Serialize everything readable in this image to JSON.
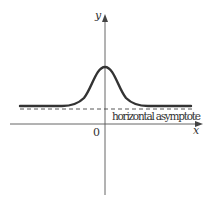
{
  "diagram": {
    "type": "function-graph",
    "axes": {
      "x_label": "x",
      "y_label": "y",
      "origin_label": "0"
    },
    "asymptote": {
      "label": "horizontal asymptote",
      "style": "dashed"
    },
    "colors": {
      "axis": "#555555",
      "curve": "#333333",
      "asymptote": "#444444"
    }
  }
}
